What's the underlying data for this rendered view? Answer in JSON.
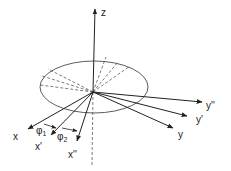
{
  "diagram": {
    "colors": {
      "stroke": "#222222",
      "background": "#ffffff"
    },
    "labels": {
      "z": "z",
      "x": "x",
      "x_prime": "x'",
      "x_double_prime": "x''",
      "y": "y",
      "y_prime": "y'",
      "y_double_prime": "y''",
      "phi1": "φ",
      "phi1_sub": "1",
      "phi2": "φ",
      "phi2_sub": "2"
    }
  }
}
